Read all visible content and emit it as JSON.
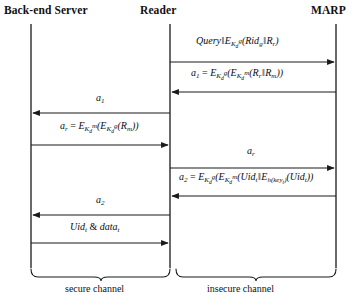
{
  "diagram": {
    "type": "sequence-diagram",
    "line_color": "#1a1a1a",
    "background": "#ffffff",
    "actors": [
      {
        "id": "backend",
        "label": "Back-end Server",
        "x": 31
      },
      {
        "id": "reader",
        "label": "Reader",
        "x": 170
      },
      {
        "id": "marp",
        "label": "MARP",
        "x": 336
      }
    ],
    "messages": [
      {
        "index": 1,
        "from": "reader",
        "to": "marp",
        "direction": "right",
        "y": 62,
        "label_y": 41,
        "label_plain": "Query || E_{K_d^g}(Rid_g || R_r)"
      },
      {
        "index": 2,
        "from": "marp",
        "to": "reader",
        "direction": "left",
        "y": 92,
        "label_y": 73,
        "label_plain": "a_1 = E_{K_d^g}(E_{K_d^m}(R_r || R_m))"
      },
      {
        "index": 3,
        "from": "reader",
        "to": "backend",
        "direction": "left",
        "y": 113,
        "label_y": 97,
        "label_plain": "a_1"
      },
      {
        "index": 4,
        "from": "backend",
        "to": "reader",
        "direction": "right",
        "y": 145,
        "label_y": 126,
        "label_plain": "a_r = E_{K_d^m}(E_{K_d^g}(R_m))"
      },
      {
        "index": 5,
        "from": "reader",
        "to": "marp",
        "direction": "right",
        "y": 168,
        "label_y": 150,
        "label_plain": "a_r"
      },
      {
        "index": 6,
        "from": "marp",
        "to": "reader",
        "direction": "left",
        "y": 196,
        "label_y": 177,
        "label_plain": "a_2 = E_{K_d^g}(E_{K_d^m}(Uid_t || E_{h(key_t)}(Uid_t))"
      },
      {
        "index": 7,
        "from": "reader",
        "to": "backend",
        "direction": "left",
        "y": 215,
        "label_y": 199,
        "label_plain": "a_2"
      },
      {
        "index": 8,
        "from": "backend",
        "to": "reader",
        "direction": "right",
        "y": 243,
        "label_y": 226,
        "label_plain": "Uid_t & data_t"
      }
    ],
    "channels": [
      {
        "id": "secure",
        "label": "secure channel",
        "from_x": 31,
        "to_x": 170
      },
      {
        "id": "insecure",
        "label": "insecure channel",
        "from_x": 176,
        "to_x": 336
      }
    ]
  }
}
